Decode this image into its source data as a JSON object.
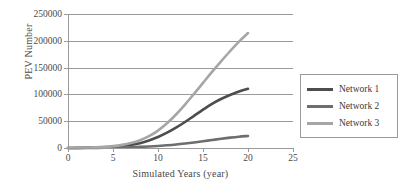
{
  "chart_data": {
    "type": "line",
    "title": "",
    "xlabel": "Simulated Years (year)",
    "ylabel": "PEV Number",
    "xlim": [
      0,
      25
    ],
    "ylim": [
      0,
      250000
    ],
    "xticks": [
      0,
      5,
      10,
      15,
      20,
      25
    ],
    "yticks": [
      0,
      50000,
      100000,
      150000,
      200000,
      250000
    ],
    "ytick_labels": [
      "0",
      "50000",
      "100000",
      "150000",
      "200000",
      "250000"
    ],
    "xtick_labels": [
      "0",
      "5",
      "10",
      "15",
      "20",
      "25"
    ],
    "grid": "horizontal",
    "legend_position": "right",
    "x": [
      0,
      1,
      2,
      3,
      4,
      5,
      6,
      7,
      8,
      9,
      10,
      11,
      12,
      13,
      14,
      15,
      16,
      17,
      18,
      19,
      20
    ],
    "series": [
      {
        "name": "Network 1",
        "color": "#4d4d4d",
        "values": [
          0,
          150,
          350,
          700,
          1300,
          2200,
          3600,
          5800,
          9000,
          14000,
          20500,
          28500,
          38000,
          48500,
          60000,
          71500,
          82500,
          91500,
          99000,
          105500,
          110500
        ]
      },
      {
        "name": "Network 2",
        "color": "#6e6e6e",
        "values": [
          0,
          60,
          140,
          260,
          430,
          680,
          1000,
          1450,
          2050,
          2850,
          3850,
          5100,
          6600,
          8400,
          10400,
          12600,
          14900,
          17200,
          19300,
          21100,
          22500
        ]
      },
      {
        "name": "Network 3",
        "color": "#a6a6a6",
        "values": [
          0,
          250,
          600,
          1150,
          2050,
          3500,
          5800,
          9300,
          14500,
          22000,
          32500,
          46000,
          62500,
          81000,
          101000,
          121500,
          142000,
          161500,
          180500,
          198500,
          214500
        ]
      }
    ]
  },
  "legend": {
    "items": [
      {
        "label": "Network 1"
      },
      {
        "label": "Network 2"
      },
      {
        "label": "Network 3"
      }
    ]
  }
}
